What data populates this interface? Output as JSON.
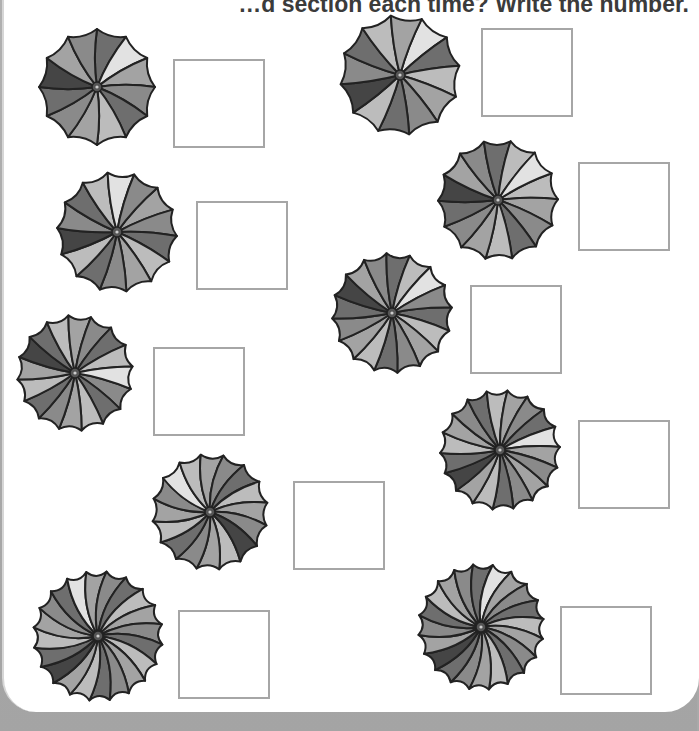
{
  "worksheet": {
    "instruction": "How many sections has the colored section moved each time? Write the number.",
    "instruction_visible": "…d section each time? Write the number."
  },
  "colors": {
    "outline": "#222222",
    "panel_shades": [
      "#6e6e6e",
      "#8a8a8a",
      "#a3a3a3",
      "#bcbcbc",
      "#dedede",
      "#4a4a4a",
      "#7a7a7a",
      "#979797"
    ],
    "box_border": "#a6a6a6",
    "background": "#a9a9a9",
    "page": "#ffffff"
  },
  "items": [
    {
      "id": 1,
      "cx": 97,
      "cy": 87,
      "r": 58,
      "segments": 12,
      "twist": 0.15,
      "highlight": 9,
      "light": 1,
      "box": {
        "x": 173,
        "y": 59,
        "answer": ""
      }
    },
    {
      "id": 2,
      "cx": 400,
      "cy": 75,
      "r": 60,
      "segments": 12,
      "twist": 0.1,
      "highlight": 7,
      "light": 0,
      "box": {
        "x": 481,
        "y": 28,
        "answer": ""
      }
    },
    {
      "id": 3,
      "cx": 117,
      "cy": 232,
      "r": 60,
      "segments": 14,
      "twist": 0.12,
      "highlight": 8,
      "light": 12,
      "box": {
        "x": 196,
        "y": 201,
        "answer": ""
      }
    },
    {
      "id": 4,
      "cx": 498,
      "cy": 200,
      "r": 60,
      "segments": 14,
      "twist": 0.12,
      "highlight": 8,
      "light": 13,
      "box": {
        "x": 578,
        "y": 162,
        "answer": ""
      }
    },
    {
      "id": 5,
      "cx": 392,
      "cy": 313,
      "r": 60,
      "segments": 16,
      "twist": 0.12,
      "highlight": 9,
      "light": 14,
      "box": {
        "x": 470,
        "y": 285,
        "answer": ""
      }
    },
    {
      "id": 6,
      "cx": 75,
      "cy": 373,
      "r": 58,
      "segments": 16,
      "twist": 0.12,
      "highlight": 8,
      "light": 15,
      "box": {
        "x": 153,
        "y": 347,
        "answer": ""
      }
    },
    {
      "id": 7,
      "cx": 500,
      "cy": 450,
      "r": 60,
      "segments": 18,
      "twist": 0.15,
      "highlight": 5,
      "light": 15,
      "box": {
        "x": 578,
        "y": 420,
        "answer": ""
      }
    },
    {
      "id": 8,
      "cx": 210,
      "cy": 512,
      "r": 58,
      "segments": 16,
      "twist": 0.3,
      "highlight": 15,
      "light": 7,
      "box": {
        "x": 293,
        "y": 481,
        "answer": ""
      }
    },
    {
      "id": 9,
      "cx": 98,
      "cy": 636,
      "r": 65,
      "segments": 20,
      "twist": 0.35,
      "highlight": 3,
      "light": 9,
      "box": {
        "x": 178,
        "y": 610,
        "answer": ""
      }
    },
    {
      "id": 10,
      "cx": 481,
      "cy": 627,
      "r": 63,
      "segments": 20,
      "twist": 0.35,
      "highlight": 2,
      "light": 10,
      "box": {
        "x": 560,
        "y": 606,
        "answer": ""
      }
    }
  ]
}
